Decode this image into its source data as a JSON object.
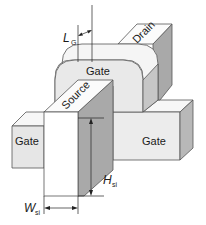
{
  "figure": {
    "labels": {
      "drain": "Drain",
      "source": "Source",
      "gate_top": "Gate",
      "gate_left": "Gate",
      "gate_right": "Gate"
    },
    "dimensions": {
      "gate_length": {
        "symbol": "L",
        "subscript": "G"
      },
      "fin_height": {
        "symbol": "H",
        "subscript": "si"
      },
      "fin_width": {
        "symbol": "W",
        "subscript": "si"
      }
    },
    "colors": {
      "light_face": "#ececec",
      "white_face": "#fbfbfb",
      "dark_face": "#a9a9a9",
      "mid_face": "#d2d2d2",
      "edge": "#555555"
    }
  }
}
